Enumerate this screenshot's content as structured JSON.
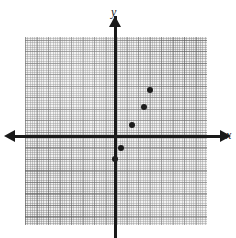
{
  "figure": {
    "name": "coordinate-plane-scatter-plot",
    "background_color": "#ffffff",
    "grid_color": "#efefef",
    "axis_color": "#1a1a1a",
    "point_color": "#1c1c1c"
  },
  "axes": {
    "x_label": "x",
    "y_label": "y",
    "x_arrow_left": "◀",
    "x_arrow_right": "▶",
    "y_arrow_top": "▲"
  },
  "chart_data": {
    "type": "scatter",
    "title": "",
    "xlabel": "x",
    "ylabel": "y",
    "grid": true,
    "legend": "none",
    "xlim": [
      -8,
      8
    ],
    "ylim": [
      -8,
      9
    ],
    "x_major_step": 1,
    "y_major_step": 1,
    "x_minor_per_major": 5,
    "y_minor_per_major": 5,
    "tick_labels_shown": false,
    "points": [
      {
        "label": "point-1",
        "x": 0,
        "y": -2
      },
      {
        "label": "point-2",
        "x": 0.5,
        "y": -1
      },
      {
        "label": "point-3",
        "x": 1.5,
        "y": 1
      },
      {
        "label": "point-4",
        "x": 2.5,
        "y": 2.5
      },
      {
        "label": "point-5",
        "x": 3,
        "y": 4
      }
    ],
    "series": [
      {
        "name": "plotted points",
        "x": [
          0,
          0.5,
          1.5,
          2.5,
          3
        ],
        "y": [
          -2,
          -1,
          1,
          2.5,
          4
        ]
      }
    ]
  },
  "geometry": {
    "origin_x_px": 115,
    "origin_y_px": 136,
    "major_px": 11.5
  }
}
